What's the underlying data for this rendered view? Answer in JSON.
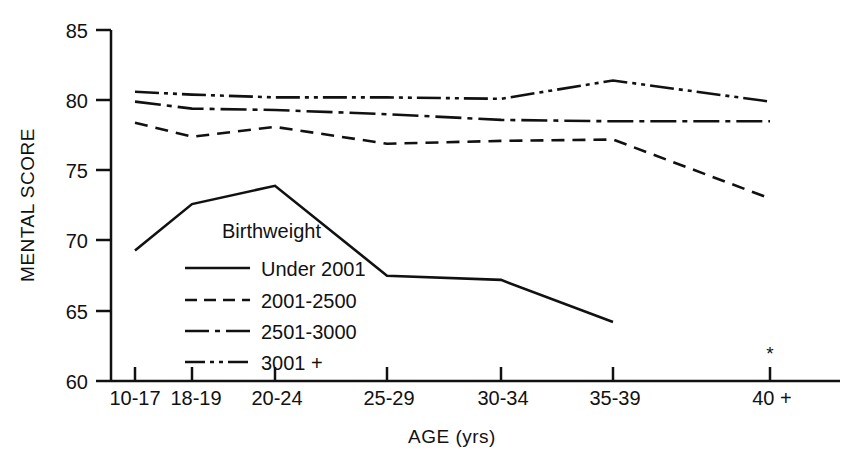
{
  "chart_data": {
    "type": "line",
    "title": "",
    "xlabel": "AGE (yrs)",
    "ylabel": "MENTAL SCORE",
    "categories": [
      "10-17",
      "18-19",
      "20-24",
      "25-29",
      "30-34",
      "35-39",
      "40 +"
    ],
    "ylim": [
      60,
      85
    ],
    "yticks": [
      60,
      65,
      70,
      75,
      80,
      85
    ],
    "ytick_labels": [
      "60",
      "65",
      "70",
      "75",
      "80",
      "85"
    ],
    "grid": false,
    "legend_position": "inside-center-left",
    "legend_title": "Birthweight",
    "annotations": [
      {
        "name": "asterisk-note",
        "text": "*",
        "category": "40 +"
      }
    ],
    "series": [
      {
        "name": "Under 2001",
        "dash": "solid",
        "color": "#111111",
        "values": [
          69.3,
          72.6,
          73.9,
          67.5,
          67.2,
          64.2,
          null
        ]
      },
      {
        "name": "2001-2500",
        "dash": "dashed",
        "color": "#111111",
        "values": [
          78.4,
          77.4,
          78.1,
          76.9,
          77.1,
          77.2,
          73.0
        ]
      },
      {
        "name": "2501-3000",
        "dash": "dash-dot",
        "color": "#111111",
        "values": [
          79.9,
          79.4,
          79.3,
          79.0,
          78.6,
          78.5,
          78.5
        ]
      },
      {
        "name": "3001 +",
        "dash": "dash-dot-dot",
        "color": "#111111",
        "values": [
          80.6,
          80.4,
          80.2,
          80.2,
          80.1,
          81.4,
          79.9
        ]
      }
    ]
  },
  "axes": {
    "y_title": "MENTAL SCORE",
    "x_title": "AGE (yrs)",
    "y_tick_labels": [
      "85",
      "80",
      "75",
      "70",
      "65",
      "60"
    ],
    "x_tick_labels": [
      "10-17",
      "18-19",
      "20-24",
      "25-29",
      "30-34",
      "35-39",
      "40 +"
    ]
  },
  "legend": {
    "title": "Birthweight",
    "entries": [
      {
        "label": "Under 2001",
        "style": "solid"
      },
      {
        "label": "2001-2500",
        "style": "dashed"
      },
      {
        "label": "2501-3000",
        "style": "dash-dot"
      },
      {
        "label": "3001 +",
        "style": "dash-dot-dot"
      }
    ]
  },
  "marks": {
    "asterisk": "*"
  },
  "colors": {
    "ink": "#111111",
    "background": "#ffffff"
  }
}
